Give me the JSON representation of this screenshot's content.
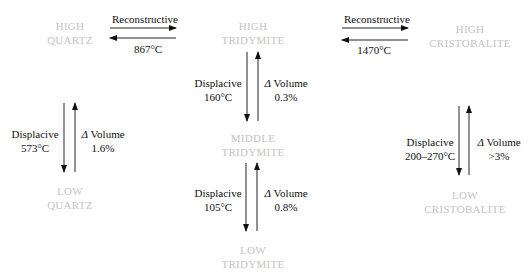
{
  "phases": {
    "high_quartz": [
      "HIGH",
      "QUARTZ"
    ],
    "high_tridymite": [
      "HIGH",
      "TRIDYMITE"
    ],
    "high_cristobalite": [
      "HIGH",
      "CRISTOBALITE"
    ],
    "middle_tridymite": [
      "MIDDLE",
      "TRIDYMITE"
    ],
    "low_quartz": [
      "LOW",
      "QUARTZ"
    ],
    "low_tridymite": [
      "LOW",
      "TRIDYMITE"
    ],
    "low_cristobalite": [
      "LOW",
      "CRISTOBALITE"
    ]
  },
  "transitions": {
    "quartz_tridymite": {
      "type": "Reconstructive",
      "temp": "867°C"
    },
    "tridymite_cristobalite": {
      "type": "Reconstructive",
      "temp": "1470°C"
    },
    "quartz_high_low": {
      "type": "Displacive",
      "temp": "573°C",
      "dv_label": "Volume",
      "dv_symbol": "Δ",
      "dv": "1.6%"
    },
    "tridymite_high_middle": {
      "type": "Displacive",
      "temp": "160°C",
      "dv_label": "Volume",
      "dv_symbol": "Δ",
      "dv": "0.3%"
    },
    "tridymite_middle_low": {
      "type": "Displacive",
      "temp": "105°C",
      "dv_label": "Volume",
      "dv_symbol": "Δ",
      "dv": "0.8%"
    },
    "cristobalite_high_low": {
      "type": "Displacive",
      "temp": "200–270°C",
      "dv_label": "Volume",
      "dv_symbol": "Δ",
      "dv": ">3%"
    }
  }
}
